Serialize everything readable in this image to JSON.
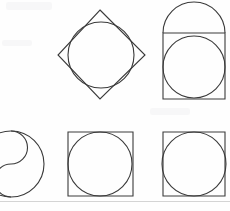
{
  "page": {
    "background_color": "#fefefe",
    "ink_color": "#3a3a3a",
    "rule_color": "#c9c9c9",
    "width": 230,
    "height": 211
  },
  "figures": [
    {
      "id": "figure-top-left-empty",
      "label": "Empty cell",
      "row": "top",
      "column": "left",
      "description": "Blank area with faint scanning smudge near the top edge",
      "shapes": []
    },
    {
      "id": "figure-circle-in-diamond",
      "label": "Circle inscribed in a rotated square",
      "row": "top",
      "column": "center",
      "description": "A square rotated 45 degrees (diamond) with a circle whose arcs cross the four sides",
      "shapes": [
        {
          "kind": "polygon",
          "name": "diamond-outline",
          "points": "100,10 145,55 100,99 58,55"
        },
        {
          "kind": "circle",
          "name": "inscribed-circle",
          "cx": 101,
          "cy": 55,
          "r": 33
        }
      ]
    },
    {
      "id": "figure-circle-in-rect-with-dome",
      "label": "Circle in rectangle topped by a semicircular dome",
      "row": "top",
      "column": "right",
      "description": "Upright rectangle containing an inscribed circle, with a semicircular arch rising above the rectangle top edge",
      "shapes": [
        {
          "kind": "rect",
          "name": "rectangle-outline",
          "x": 163,
          "y": 33,
          "width": 62,
          "height": 66
        },
        {
          "kind": "arc",
          "name": "dome-semicircle",
          "path": "M163,33 A31,31 0 0 1 225,33"
        },
        {
          "kind": "circle",
          "name": "inscribed-circle",
          "cx": 194,
          "cy": 67,
          "r": 31
        }
      ]
    },
    {
      "id": "figure-yin-yang",
      "label": "Circle divided by an S-curve (taijitu)",
      "row": "bottom",
      "column": "left",
      "description": "Large circle cropped by the left page edge, split by two tangent semicircular arcs forming an S",
      "shapes": [
        {
          "kind": "circle",
          "name": "outer-circle",
          "cx": 11,
          "cy": 164,
          "r": 33
        },
        {
          "kind": "arc",
          "name": "upper-s-arc",
          "path": "M11,131 A16.5,16.5 0 0 1 11,164"
        },
        {
          "kind": "arc",
          "name": "lower-s-arc",
          "path": "M11,164 A16.5,16.5 0 0 0 11,197"
        }
      ]
    },
    {
      "id": "figure-circle-in-square-a",
      "label": "Circle inscribed in a square",
      "row": "bottom",
      "column": "center",
      "description": "Square with a circle touching all four sides",
      "shapes": [
        {
          "kind": "rect",
          "name": "square-outline",
          "x": 68,
          "y": 132,
          "width": 65,
          "height": 64
        },
        {
          "kind": "circle",
          "name": "inscribed-circle",
          "cx": 100,
          "cy": 164,
          "r": 32
        }
      ]
    },
    {
      "id": "figure-circle-in-square-b",
      "label": "Circle inscribed in a square",
      "row": "bottom",
      "column": "right",
      "description": "Square with a circle touching all four sides, circle drawn slightly oversize so arcs graze the corners",
      "shapes": [
        {
          "kind": "rect",
          "name": "square-outline",
          "x": 163,
          "y": 132,
          "width": 62,
          "height": 64
        },
        {
          "kind": "circle",
          "name": "inscribed-circle",
          "cx": 194,
          "cy": 164,
          "r": 32
        }
      ]
    }
  ],
  "rules": [
    {
      "id": "bottom-page-rule",
      "name": "page-separator-line",
      "y": 201
    }
  ]
}
